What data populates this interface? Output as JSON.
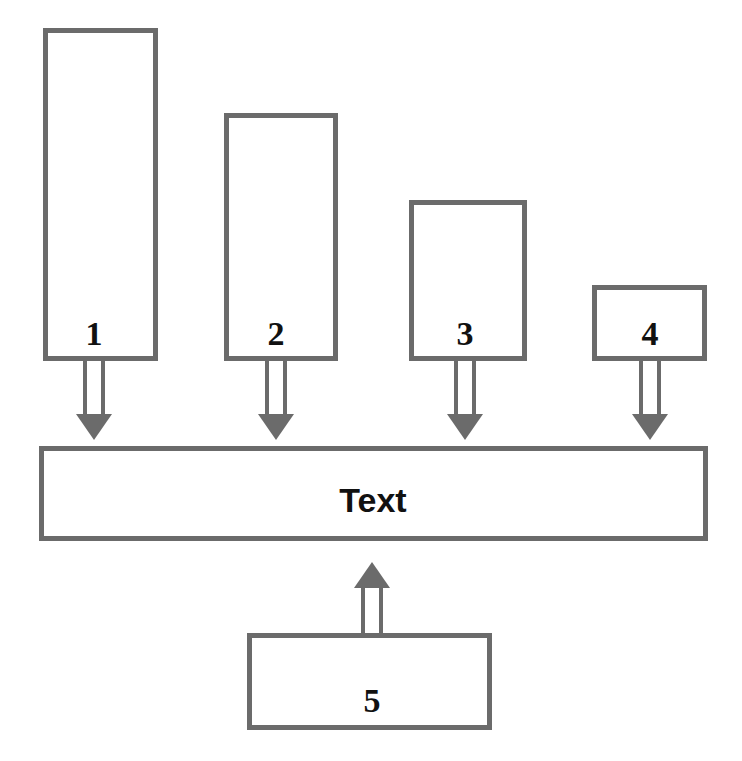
{
  "diagram": {
    "title": "Text",
    "type": "block-diagram",
    "canvas": {
      "width": 742,
      "height": 761,
      "background": "#ffffff"
    },
    "style": {
      "stroke_color": "#6b6b6b",
      "arrow_head_color": "#6b6b6b",
      "box_fill": "#ffffff",
      "label_color": "#111111",
      "stroke_width": 5
    },
    "central_bar": {
      "label": "Text",
      "x": 39,
      "y": 446,
      "width": 669,
      "height": 95,
      "label_x": 373,
      "label_y": 512,
      "label_size": 34
    },
    "nodes": [
      {
        "label": "1",
        "x": 43,
        "y": 28,
        "width": 115,
        "height": 333,
        "label_x": 94,
        "label_y": 345,
        "label_size": 34,
        "arrow_direction": "down",
        "arrow_x": 94,
        "arrow_from_y": 361,
        "arrow_to_y": 440
      },
      {
        "label": "2",
        "x": 224,
        "y": 113,
        "width": 114,
        "height": 248,
        "label_x": 276,
        "label_y": 345,
        "label_size": 34,
        "arrow_direction": "down",
        "arrow_x": 276,
        "arrow_from_y": 361,
        "arrow_to_y": 440
      },
      {
        "label": "3",
        "x": 409,
        "y": 200,
        "width": 118,
        "height": 161,
        "label_x": 465,
        "label_y": 345,
        "label_size": 34,
        "arrow_direction": "down",
        "arrow_x": 465,
        "arrow_from_y": 361,
        "arrow_to_y": 440
      },
      {
        "label": "4",
        "x": 592,
        "y": 285,
        "width": 115,
        "height": 76,
        "label_x": 650,
        "label_y": 345,
        "label_size": 34,
        "arrow_direction": "down",
        "arrow_x": 650,
        "arrow_from_y": 361,
        "arrow_to_y": 440
      },
      {
        "label": "5",
        "x": 247,
        "y": 633,
        "width": 245,
        "height": 97,
        "label_x": 372,
        "label_y": 712,
        "label_size": 34,
        "arrow_direction": "up",
        "arrow_x": 372,
        "arrow_from_y": 633,
        "arrow_to_y": 562
      }
    ],
    "arrow_geometry": {
      "shaft_half_width": 9,
      "head_half_width": 18,
      "head_length": 26
    }
  },
  "chart_data": {
    "type": "bar",
    "title": "Text",
    "categories": [
      "1",
      "2",
      "3",
      "4"
    ],
    "values": [
      333,
      248,
      161,
      76
    ],
    "xlabel": "",
    "ylabel": "",
    "note": "Four descending blocks feed arrows down into a central bar labelled Text; block 5 feeds an arrow upward into the same bar."
  }
}
